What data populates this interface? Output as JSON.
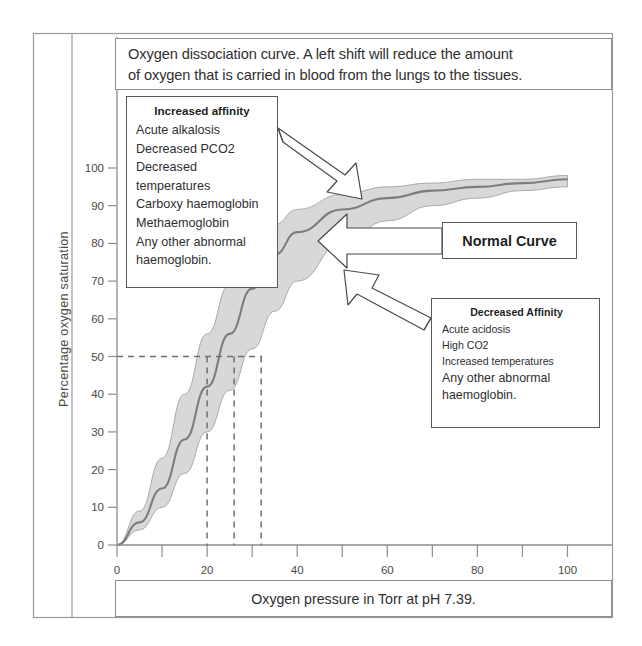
{
  "title": {
    "line1": "Oxygen dissociation curve. A left shift will reduce the amount",
    "line2": "of oxygen that is carried in blood from the lungs to the tissues."
  },
  "axes": {
    "ylabel": "Percentage oxygen saturation",
    "xlabel": "Oxygen pressure in Torr at pH 7.39."
  },
  "callouts": {
    "increased": {
      "heading": "Increased affinity",
      "items": [
        "Acute alkalosis",
        "Decreased PCO2",
        "Decreased",
        "temperatures",
        "Carboxy haemoglobin",
        "Methaemoglobin",
        "Any other abnormal",
        "haemoglobin."
      ]
    },
    "decreased": {
      "heading": "Decreased Affinity",
      "items": [
        "Acute acidosis",
        "High CO2",
        "Increased temperatures",
        "Any other abnormal",
        "haemoglobin."
      ]
    },
    "normal": {
      "label": "Normal Curve"
    }
  },
  "chart_data": {
    "type": "line",
    "title": "Oxygen dissociation curve. A left shift will reduce the amount of oxygen that is carried in blood from the lungs to the tissues.",
    "xlabel": "Oxygen pressure in Torr at pH 7.39.",
    "ylabel": "Percentage oxygen saturation",
    "xlim": [
      0,
      105
    ],
    "ylim": [
      0,
      103
    ],
    "xticks": [
      0,
      10,
      20,
      30,
      40,
      50,
      60,
      70,
      80,
      90,
      100
    ],
    "xticklabels": [
      "0",
      "",
      "20",
      "",
      "40",
      "",
      "60",
      "",
      "80",
      "",
      "100"
    ],
    "yticks": [
      0,
      10,
      20,
      30,
      40,
      50,
      60,
      70,
      80,
      90,
      100
    ],
    "yticklabels": [
      "0",
      "10",
      "20",
      "30",
      "40",
      "50",
      "60",
      "70",
      "80",
      "90",
      "100"
    ],
    "grid": false,
    "legend": "none",
    "shaded_band": true,
    "band_fill": "#c9c9c9",
    "curve_color": "#7d7d7d",
    "x": [
      0,
      5,
      10,
      15,
      20,
      25,
      30,
      35,
      40,
      50,
      60,
      70,
      80,
      90,
      100
    ],
    "series": [
      {
        "name": "Left shift (increased affinity)",
        "p50": 20,
        "values": [
          0,
          9,
          23,
          40,
          56,
          69,
          79,
          85,
          89,
          93,
          95,
          96,
          97,
          97,
          98
        ]
      },
      {
        "name": "Normal curve",
        "p50": 26,
        "values": [
          0,
          6,
          15,
          28,
          42,
          56,
          68,
          77,
          83,
          89,
          92,
          94,
          95,
          96,
          97
        ]
      },
      {
        "name": "Right shift (decreased affinity)",
        "p50": 32,
        "values": [
          0,
          4,
          10,
          19,
          30,
          41,
          52,
          62,
          70,
          80,
          86,
          90,
          92,
          94,
          95
        ]
      }
    ],
    "reference_lines": {
      "horizontal": [
        50
      ],
      "vertical": [
        20,
        26,
        32
      ],
      "style": "dashed",
      "note": "P50 values where saturation is 50%"
    },
    "annotations": [
      {
        "text": "Increased affinity",
        "points_to": "left-shifted curve"
      },
      {
        "text": "Normal Curve",
        "points_to": "middle curve"
      },
      {
        "text": "Decreased Affinity",
        "points_to": "right-shifted curve"
      }
    ]
  }
}
